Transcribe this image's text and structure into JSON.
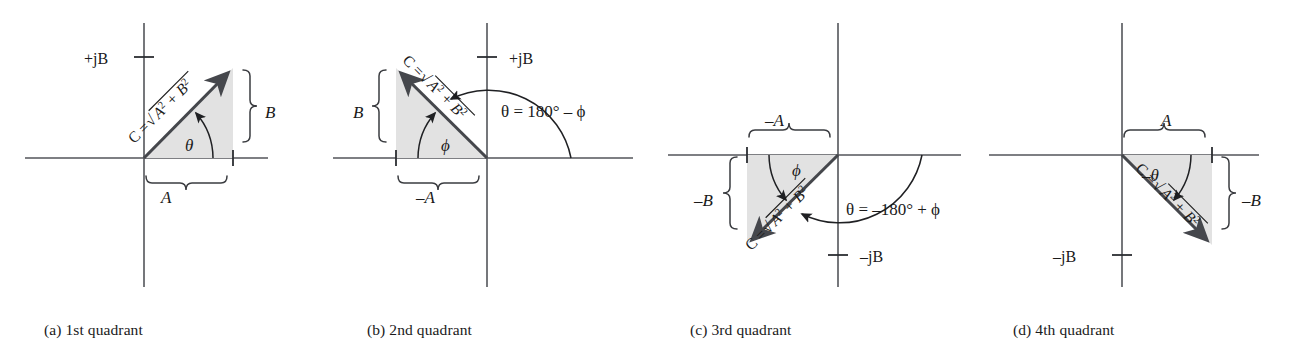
{
  "figure": {
    "colors": {
      "axis": "#53555a",
      "vector": "#45474c",
      "triangle_fill": "#e2e2e2",
      "text": "#1a1a1a",
      "background": "#ffffff"
    }
  },
  "panels": [
    {
      "id": "panel-a",
      "caption": "(a) 1st quadrant",
      "quadrant": 1,
      "magnitude_label": "C =",
      "radical_label": "A2 + B2",
      "radical_sign": "√",
      "angle_label": "θ",
      "axis_label": "+jB",
      "horizontal_leg_label": "A",
      "vertical_leg_label": "B",
      "relation": ""
    },
    {
      "id": "panel-b",
      "caption": "(b) 2nd quadrant",
      "quadrant": 2,
      "magnitude_label": "C =",
      "radical_label": "A2 + B2",
      "radical_sign": "√",
      "angle_label": "ϕ",
      "axis_label": "+jB",
      "horizontal_leg_label": "–A",
      "vertical_leg_label": "B",
      "relation": "θ = 180° – ϕ"
    },
    {
      "id": "panel-c",
      "caption": "(c) 3rd quadrant",
      "quadrant": 3,
      "magnitude_label": "C =",
      "radical_label": "A2 + B2",
      "radical_sign": "√",
      "angle_label": "ϕ",
      "axis_label": "–jB",
      "horizontal_leg_label": "–A",
      "vertical_leg_label": "–B",
      "relation": "θ = –180° + ϕ"
    },
    {
      "id": "panel-d",
      "caption": "(d) 4th quadrant",
      "quadrant": 4,
      "magnitude_label": "C =",
      "radical_label": "A2 + B2",
      "radical_sign": "√",
      "angle_label": "–θ",
      "axis_label": "–jB",
      "horizontal_leg_label": "A",
      "vertical_leg_label": "–B",
      "relation": ""
    }
  ]
}
